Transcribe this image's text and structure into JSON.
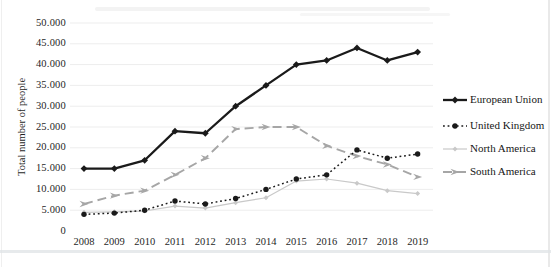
{
  "chart_data": {
    "type": "line",
    "title": "",
    "xlabel": "",
    "ylabel": "Total number of people",
    "ylim": [
      0,
      50000
    ],
    "grid": "horizontal",
    "legend_position": "right",
    "x": [
      2008,
      2009,
      2010,
      2011,
      2012,
      2013,
      2014,
      2015,
      2016,
      2017,
      2018,
      2019
    ],
    "x_labels": [
      "2008",
      "2009",
      "2010",
      "2011",
      "2012",
      "2013",
      "2014",
      "2015",
      "2016",
      "2017",
      "2018",
      "2019"
    ],
    "y_ticks": [
      0,
      5000,
      10000,
      15000,
      20000,
      25000,
      30000,
      35000,
      40000,
      45000,
      50000
    ],
    "y_tick_labels": [
      "0",
      "5.000",
      "10.000",
      "15.000",
      "20.000",
      "25.000",
      "30.000",
      "35.000",
      "40.000",
      "45.000",
      "50.000"
    ],
    "series": [
      {
        "name": "European Union",
        "color": "#1a1a1a",
        "style": "solid",
        "width": 2.3,
        "marker": "diamond",
        "values": [
          15000,
          15000,
          17000,
          24000,
          23500,
          30000,
          35000,
          40000,
          41000,
          44000,
          41000,
          43000
        ]
      },
      {
        "name": "United Kingdom",
        "color": "#1a1a1a",
        "style": "dotted",
        "width": 1.5,
        "marker": "circle",
        "values": [
          4000,
          4300,
          5000,
          7200,
          6500,
          7800,
          10000,
          12500,
          13500,
          19500,
          17500,
          18500
        ]
      },
      {
        "name": "North America",
        "color": "#c9c9c9",
        "style": "solid",
        "width": 1.2,
        "marker": "diamond-small",
        "values": [
          4500,
          4600,
          4800,
          6000,
          5500,
          6800,
          8000,
          12000,
          12500,
          11500,
          9700,
          9000
        ]
      },
      {
        "name": "South America",
        "color": "#a6a6a6",
        "style": "dashed",
        "width": 1.9,
        "marker": "arrow",
        "values": [
          6500,
          8500,
          9700,
          13500,
          17500,
          24500,
          25000,
          25000,
          20500,
          18000,
          16000,
          13000
        ]
      }
    ]
  }
}
